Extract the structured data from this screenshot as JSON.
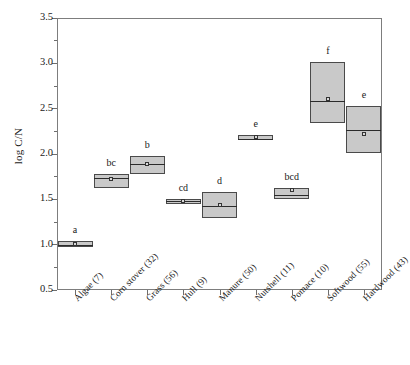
{
  "chart_data": {
    "type": "box",
    "title": "",
    "xlabel": "",
    "ylabel": "log C/N",
    "ylim": [
      0.5,
      3.5
    ],
    "yticks": [
      "0.5",
      "1.0",
      "1.5",
      "2.0",
      "2.5",
      "3.0",
      "3.5"
    ],
    "ytick_values": [
      0.5,
      1.0,
      1.5,
      2.0,
      2.5,
      3.0,
      3.5
    ],
    "grid": false,
    "legend": "none",
    "categories": [
      "Algae (7)",
      "Corn stover (32)",
      "Grass (56)",
      "Hull (9)",
      "Manure (50)",
      "Nutshell (11)",
      "Pomace (10)",
      "Softwood (55)",
      "Hardwood (43)"
    ],
    "boxes": [
      {
        "category": "Algae (7)",
        "n": 7,
        "lower": 0.97,
        "median": 1.0,
        "upper": 1.04,
        "mean": 1.01,
        "letter": "a"
      },
      {
        "category": "Corn stover (32)",
        "n": 32,
        "lower": 1.63,
        "median": 1.74,
        "upper": 1.78,
        "mean": 1.72,
        "letter": "bc"
      },
      {
        "category": "Grass (56)",
        "n": 56,
        "lower": 1.78,
        "median": 1.89,
        "upper": 1.98,
        "mean": 1.89,
        "letter": "b"
      },
      {
        "category": "Hull (9)",
        "n": 9,
        "lower": 1.45,
        "median": 1.48,
        "upper": 1.5,
        "mean": 1.48,
        "letter": "cd"
      },
      {
        "category": "Manure (50)",
        "n": 50,
        "lower": 1.29,
        "median": 1.43,
        "upper": 1.58,
        "mean": 1.44,
        "letter": "d"
      },
      {
        "category": "Nutshell (11)",
        "n": 11,
        "lower": 2.15,
        "median": 2.17,
        "upper": 2.21,
        "mean": 2.19,
        "letter": "e"
      },
      {
        "category": "Pomace (10)",
        "n": 10,
        "lower": 1.5,
        "median": 1.55,
        "upper": 1.62,
        "mean": 1.6,
        "letter": "bcd"
      },
      {
        "category": "Softwood (55)",
        "n": 55,
        "lower": 2.34,
        "median": 2.59,
        "upper": 3.02,
        "mean": 2.61,
        "letter": "f"
      },
      {
        "category": "Hardwood (43)",
        "n": 43,
        "lower": 2.01,
        "median": 2.26,
        "upper": 2.53,
        "mean": 2.22,
        "letter": "e"
      }
    ],
    "colors": {
      "box_fill": "#c9c9c9",
      "box_edge": "#4a4a4a",
      "median_line": "#2b2b2b",
      "axis": "#7d7d7d",
      "text": "#1a1a1a",
      "background": "#ffffff"
    }
  }
}
